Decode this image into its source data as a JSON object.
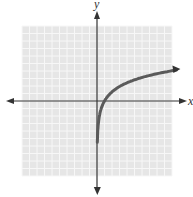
{
  "chart_data": {
    "type": "line",
    "title": "",
    "xlabel": "x",
    "ylabel": "y",
    "xlim": [
      -10,
      10
    ],
    "ylim": [
      -10,
      10
    ],
    "grid": true,
    "legend": null,
    "tick_labels": [],
    "series": [
      {
        "name": "f(x)",
        "description": "logarithmic-type curve with vertical asymptote at x = 0, x-intercept near (1, 0), increasing slowly to about y = 4 at x = 10",
        "x": [
          0.05,
          0.1,
          0.2,
          0.5,
          1,
          2,
          3,
          4,
          5,
          6,
          7,
          8,
          9,
          10.8
        ],
        "y": [
          -12,
          -9.4,
          -6.4,
          -2.6,
          0,
          1.2,
          1.9,
          2.4,
          2.8,
          3.1,
          3.3,
          3.6,
          3.8,
          4.1
        ]
      }
    ],
    "colors": {
      "grid_bg": "#e6e6e6",
      "grid_line": "#f7f7f7",
      "axis": "#333333",
      "curve": "#5a5a5a"
    }
  },
  "labels": {
    "x_axis": "x",
    "y_axis": "y"
  }
}
